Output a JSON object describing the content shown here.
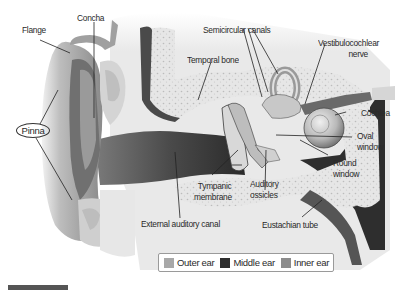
{
  "labels": {
    "flange": "Flange",
    "concha": "Concha",
    "pinna": "Pinna",
    "semicircular_canals": "Semicircular canals",
    "temporal_bone": "Temporal bone",
    "vestibulocochlear_nerve_line1": "Vestibulocochlear",
    "vestibulocochlear_nerve_line2": "nerve",
    "cochlea": "Cochlea",
    "oval_window_line1": "Oval",
    "oval_window_line2": "window",
    "round_window_line1": "Round",
    "round_window_line2": "window",
    "tympanic_membrane_line1": "Tympanic",
    "tympanic_membrane_line2": "membrane",
    "auditory_ossicles_line1": "Auditory",
    "auditory_ossicles_line2": "ossicles",
    "external_auditory_canal": "External auditory canal",
    "eustachian_tube": "Eustachian tube"
  },
  "legend": [
    {
      "label": "Outer ear",
      "color": "#a8a8a8"
    },
    {
      "label": "Middle ear",
      "color": "#2e2e2e"
    },
    {
      "label": "Inner ear",
      "color": "#8c8c8c"
    }
  ],
  "colors": {
    "skin_light": "#d9d9d9",
    "skin_mid": "#9e9e9e",
    "skin_dark": "#5a5a5a",
    "bone": "#e4e4e4",
    "bone_dots": "#bdbdbd",
    "canal_dark": "#3a3a3a",
    "leader_line": "#222222"
  }
}
